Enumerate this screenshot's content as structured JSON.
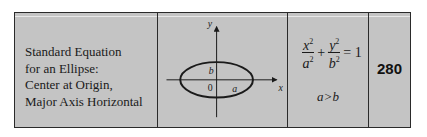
{
  "table": {
    "title_lines": [
      "Standard Equation",
      "for an Ellipse:",
      "Center at Origin,",
      "Major Axis Horizontal"
    ],
    "diagram": {
      "x_axis_label": "x",
      "y_axis_label": "y",
      "origin_label": "0",
      "semi_minor_label": "b",
      "semi_major_label": "a"
    },
    "equation": {
      "term1_num": "x",
      "term1_den": "a",
      "term2_num": "y",
      "term2_den": "b",
      "exponent": "2",
      "plus": "+",
      "equals": "= 1"
    },
    "condition": "a>b",
    "page_number": "280"
  },
  "colors": {
    "background": "#c4c4c4",
    "border": "#2a2a2a",
    "text": "#1a1a1a"
  }
}
